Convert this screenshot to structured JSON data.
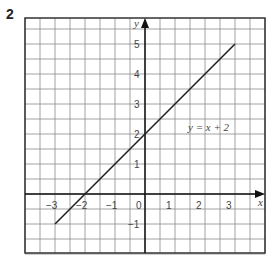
{
  "question": {
    "number": "2"
  },
  "chart_data": {
    "type": "line",
    "title": "",
    "xlabel": "x",
    "ylabel": "y",
    "xlim": [
      -4,
      4
    ],
    "ylim": [
      -2,
      5.8
    ],
    "grid": true,
    "grid_step": 0.5,
    "x_ticks": [
      "-3",
      "-2",
      "-1",
      "0",
      "1",
      "2",
      "3"
    ],
    "y_ticks": [
      "-1",
      "1",
      "2",
      "3",
      "4",
      "5"
    ],
    "series": [
      {
        "name": "y = x + 2",
        "x": [
          -3,
          3
        ],
        "y": [
          -1,
          5
        ]
      }
    ],
    "annotations": [
      {
        "text": "y = x + 2",
        "x": 2,
        "y": 2.2
      }
    ]
  }
}
